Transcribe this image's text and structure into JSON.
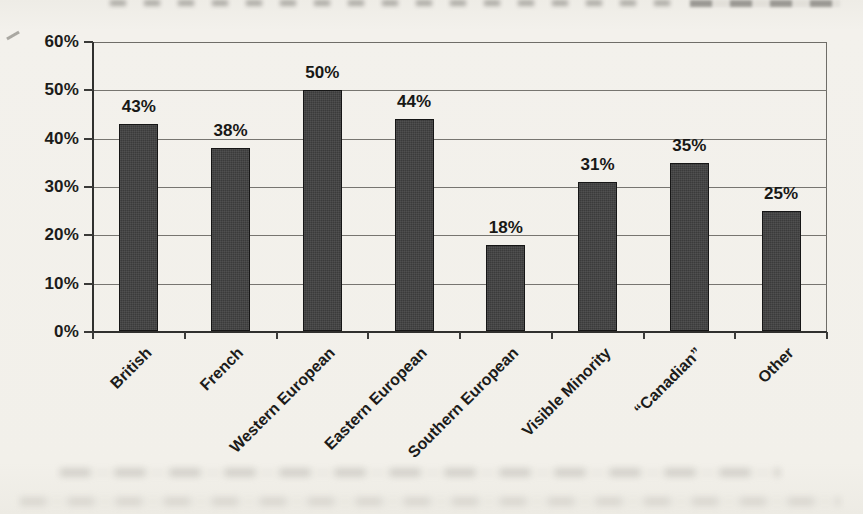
{
  "page": {
    "kind": "scanned book figure",
    "background_color": "#f2f0ea"
  },
  "chart_data": {
    "type": "bar",
    "title": "",
    "xlabel": "",
    "ylabel": "",
    "categories": [
      "British",
      "French",
      "Western European",
      "Eastern European",
      "Southern European",
      "Visible Minority",
      "“Canadian”",
      "Other"
    ],
    "values": [
      43,
      38,
      50,
      44,
      18,
      31,
      35,
      25
    ],
    "data_labels": [
      "43%",
      "38%",
      "50%",
      "44%",
      "18%",
      "31%",
      "35%",
      "25%"
    ],
    "y_ticks_top_to_bottom": [
      "60%",
      "50%",
      "40%",
      "30%",
      "20%",
      "10%",
      "0%"
    ],
    "ylim": [
      0,
      60
    ],
    "y_tick_step": 10,
    "grid": true,
    "legend": "none",
    "x_label_rotation_deg": -45,
    "bar_color": "#3b3b3b",
    "bar_border_color": "#161616",
    "axis_color": "#30302e",
    "gridline_color": "#777570",
    "text_color": "#1c1c1a"
  }
}
